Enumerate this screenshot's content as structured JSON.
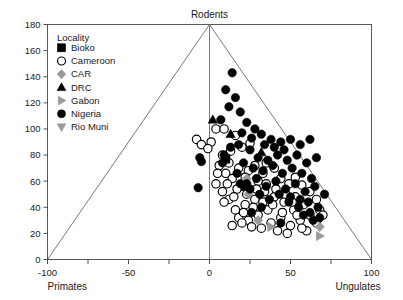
{
  "chart_data": {
    "type": "scatter",
    "title": "",
    "xlabel": "Primates",
    "xlabel_right": "Ungulates",
    "ylabel": "",
    "top_label": "Rodents",
    "xlim": [
      -100,
      100
    ],
    "ylim": [
      0,
      180
    ],
    "xticks": [
      -100,
      -50,
      0,
      50,
      100
    ],
    "xtick_labels": [
      "-100",
      "-50",
      "0",
      "50",
      "100"
    ],
    "xminor_ticks": [
      -75,
      -25,
      25,
      75
    ],
    "yticks": [
      0,
      20,
      40,
      60,
      80,
      100,
      120,
      140,
      160,
      180
    ],
    "ytick_labels": [
      "0",
      "20",
      "40",
      "60",
      "80",
      "100",
      "120",
      "140",
      "160",
      "180"
    ],
    "grid": false,
    "legend_position": "upper-left",
    "reference_triangle": {
      "apex": [
        0,
        180
      ],
      "left": [
        -100,
        0
      ],
      "right": [
        100,
        0
      ]
    },
    "legend_title": "Locality",
    "series": [
      {
        "name": "Bioko",
        "marker": "square",
        "color": "#000000",
        "filled": true,
        "points": [
          [
            22,
            56
          ],
          [
            10,
            77
          ]
        ]
      },
      {
        "name": "Cameroon",
        "marker": "circle",
        "color": "#000000",
        "filled": false,
        "points": [
          [
            4,
            100
          ],
          [
            9,
            100
          ],
          [
            1,
            90
          ],
          [
            -8,
            92
          ],
          [
            -5,
            88
          ],
          [
            -1,
            85
          ],
          [
            16,
            95
          ],
          [
            13,
            83
          ],
          [
            8,
            80
          ],
          [
            12,
            74
          ],
          [
            20,
            86
          ],
          [
            25,
            89
          ],
          [
            18,
            70
          ],
          [
            24,
            68
          ],
          [
            28,
            72
          ],
          [
            33,
            66
          ],
          [
            30,
            60
          ],
          [
            22,
            63
          ],
          [
            14,
            62
          ],
          [
            10,
            66
          ],
          [
            6,
            72
          ],
          [
            35,
            74
          ],
          [
            40,
            70
          ],
          [
            44,
            62
          ],
          [
            49,
            58
          ],
          [
            53,
            63
          ],
          [
            57,
            57
          ],
          [
            62,
            52
          ],
          [
            66,
            46
          ],
          [
            58,
            42
          ],
          [
            52,
            38
          ],
          [
            46,
            44
          ],
          [
            40,
            48
          ],
          [
            34,
            52
          ],
          [
            28,
            46
          ],
          [
            22,
            42
          ],
          [
            16,
            38
          ],
          [
            12,
            46
          ],
          [
            8,
            52
          ],
          [
            4,
            58
          ],
          [
            18,
            32
          ],
          [
            24,
            30
          ],
          [
            30,
            34
          ],
          [
            36,
            38
          ],
          [
            26,
            25
          ],
          [
            20,
            28
          ],
          [
            14,
            26
          ],
          [
            32,
            24
          ],
          [
            38,
            28
          ],
          [
            44,
            32
          ],
          [
            50,
            26
          ],
          [
            56,
            30
          ],
          [
            62,
            34
          ],
          [
            68,
            38
          ],
          [
            42,
            22
          ],
          [
            48,
            20
          ],
          [
            54,
            34
          ],
          [
            66,
            28
          ],
          [
            70,
            34
          ],
          [
            60,
            22
          ],
          [
            11,
            58
          ],
          [
            17,
            54
          ],
          [
            23,
            50
          ],
          [
            29,
            54
          ],
          [
            35,
            58
          ],
          [
            41,
            54
          ],
          [
            47,
            50
          ],
          [
            53,
            48
          ],
          [
            5,
            66
          ],
          [
            9,
            44
          ],
          [
            15,
            48
          ],
          [
            21,
            36
          ],
          [
            27,
            40
          ],
          [
            33,
            44
          ],
          [
            39,
            42
          ],
          [
            45,
            36
          ],
          [
            51,
            44
          ],
          [
            57,
            24
          ]
        ]
      },
      {
        "name": "CAR",
        "marker": "diamond",
        "color": "#9a9a9a",
        "filled": true,
        "points": [
          [
            23,
            62
          ],
          [
            24,
            50
          ],
          [
            30,
            30
          ],
          [
            68,
            25
          ]
        ]
      },
      {
        "name": "DRC",
        "marker": "triangle-up",
        "color": "#000000",
        "filled": true,
        "points": [
          [
            2,
            107
          ],
          [
            13,
            96
          ],
          [
            32,
            82
          ]
        ]
      },
      {
        "name": "Gabon",
        "marker": "triangle-right",
        "color": "#9a9a9a",
        "filled": true,
        "points": [
          [
            38,
            25
          ],
          [
            68,
            18
          ]
        ]
      },
      {
        "name": "Nigeria",
        "marker": "circle",
        "color": "#000000",
        "filled": true,
        "points": [
          [
            14,
            143
          ],
          [
            10,
            130
          ],
          [
            16,
            124
          ],
          [
            12,
            117
          ],
          [
            19,
            113
          ],
          [
            7,
            107
          ],
          [
            9,
            80
          ],
          [
            10,
            78
          ],
          [
            8,
            74
          ],
          [
            -6,
            78
          ],
          [
            -5,
            75
          ],
          [
            -7,
            55
          ],
          [
            23,
            105
          ],
          [
            28,
            100
          ],
          [
            20,
            97
          ],
          [
            26,
            93
          ],
          [
            32,
            96
          ],
          [
            38,
            92
          ],
          [
            44,
            90
          ],
          [
            50,
            92
          ],
          [
            34,
            88
          ],
          [
            40,
            86
          ],
          [
            46,
            84
          ],
          [
            56,
            88
          ],
          [
            62,
            92
          ],
          [
            25,
            84
          ],
          [
            18,
            88
          ],
          [
            13,
            86
          ],
          [
            30,
            78
          ],
          [
            36,
            76
          ],
          [
            42,
            80
          ],
          [
            48,
            76
          ],
          [
            54,
            80
          ],
          [
            60,
            74
          ],
          [
            66,
            78
          ],
          [
            21,
            74
          ],
          [
            27,
            70
          ],
          [
            33,
            68
          ],
          [
            39,
            72
          ],
          [
            45,
            66
          ],
          [
            51,
            70
          ],
          [
            57,
            66
          ],
          [
            63,
            62
          ],
          [
            17,
            66
          ],
          [
            23,
            58
          ],
          [
            29,
            62
          ],
          [
            35,
            56
          ],
          [
            41,
            60
          ],
          [
            47,
            54
          ],
          [
            53,
            58
          ],
          [
            59,
            52
          ],
          [
            65,
            56
          ],
          [
            71,
            50
          ],
          [
            19,
            58
          ],
          [
            25,
            54
          ],
          [
            31,
            50
          ],
          [
            37,
            46
          ],
          [
            43,
            50
          ],
          [
            49,
            44
          ],
          [
            55,
            40
          ],
          [
            61,
            44
          ],
          [
            67,
            40
          ],
          [
            26,
            36
          ],
          [
            32,
            40
          ],
          [
            50,
            48
          ],
          [
            56,
            46
          ],
          [
            62,
            36
          ],
          [
            68,
            32
          ],
          [
            44,
            28
          ],
          [
            58,
            34
          ],
          [
            64,
            30
          ]
        ]
      },
      {
        "name": "Rio Muni",
        "marker": "triangle-down",
        "color": "#9a9a9a",
        "filled": true,
        "points": []
      }
    ]
  }
}
